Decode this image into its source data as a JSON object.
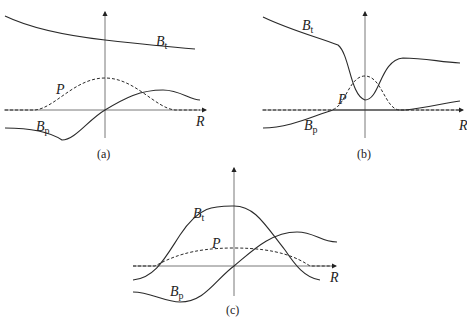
{
  "figure": {
    "panels": [
      {
        "id": "a",
        "caption": "(a)",
        "axis_label": "R",
        "curves": [
          {
            "name": "B",
            "subscript": "t",
            "style": "solid",
            "shape": "monotonically decreasing, above axis"
          },
          {
            "name": "P",
            "subscript": "",
            "style": "dashed",
            "shape": "single broad hump centered at origin"
          },
          {
            "name": "B",
            "subscript": "p",
            "style": "solid",
            "shape": "odd function: negative minimum left, positive maximum right"
          }
        ]
      },
      {
        "id": "b",
        "caption": "(b)",
        "axis_label": "R",
        "curves": [
          {
            "name": "B",
            "subscript": "t",
            "style": "solid",
            "shape": "high at edges with deep well at center"
          },
          {
            "name": "P",
            "subscript": "",
            "style": "dashed",
            "shape": "narrow peak at center"
          },
          {
            "name": "B",
            "subscript": "p",
            "style": "solid",
            "shape": "negative left, zero near center, slightly positive right"
          }
        ]
      },
      {
        "id": "c",
        "caption": "(c)",
        "axis_label": "R",
        "curves": [
          {
            "name": "B",
            "subscript": "t",
            "style": "solid",
            "shape": "large bell-shaped peak at center, negative at far edges"
          },
          {
            "name": "P",
            "subscript": "",
            "style": "dashed",
            "shape": "flat broad plateau"
          },
          {
            "name": "B",
            "subscript": "p",
            "style": "solid",
            "shape": "odd function crossing zero at origin"
          }
        ]
      }
    ]
  }
}
